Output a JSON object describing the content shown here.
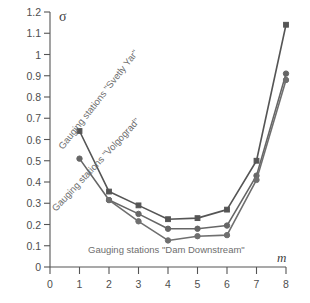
{
  "chart_data": {
    "type": "line",
    "title": "",
    "xlabel": "m",
    "ylabel": "σ",
    "xlim": [
      0,
      8
    ],
    "ylim": [
      0,
      1.2
    ],
    "grid": false,
    "legend_position": "inline-annotations",
    "x_ticks": [
      "0",
      "1",
      "2",
      "3",
      "4",
      "5",
      "6",
      "7",
      "8"
    ],
    "y_ticks": [
      "0",
      "0.1",
      "0.2",
      "0.3",
      "0.4",
      "0.5",
      "0.6",
      "0.7",
      "0.8",
      "0.9",
      "1",
      "1.1",
      "1.2"
    ],
    "series": [
      {
        "name": "Gauging stations \"Svetly Yar\"",
        "marker": "square",
        "color": "#555555",
        "x": [
          1,
          2,
          3,
          4,
          5,
          6,
          7,
          8
        ],
        "values": [
          0.64,
          0.355,
          0.29,
          0.225,
          0.23,
          0.27,
          0.5,
          1.14
        ]
      },
      {
        "name": "Gauging stations \"Volgograd\"",
        "marker": "circle",
        "color": "#666666",
        "x": [
          1,
          2,
          3,
          4,
          5,
          6,
          7,
          8
        ],
        "values": [
          0.51,
          0.315,
          0.25,
          0.18,
          0.18,
          0.195,
          0.43,
          0.91
        ]
      },
      {
        "name": "Gauging stations \"Dam Downstream\"",
        "marker": "circle",
        "color": "#6f6f6f",
        "x": [
          2,
          3,
          4,
          5,
          6,
          7,
          8
        ],
        "values": [
          0.315,
          0.215,
          0.125,
          0.145,
          0.15,
          0.41,
          0.88
        ]
      }
    ],
    "annotations": [
      {
        "text": "Gauging stations \"Svetly Yar\"",
        "rotation": -52
      },
      {
        "text": "Gauging stations \"Volgograd\"",
        "rotation": -47
      },
      {
        "text": "Gauging stations \"Dam Downstream\"",
        "rotation": 0
      }
    ]
  }
}
